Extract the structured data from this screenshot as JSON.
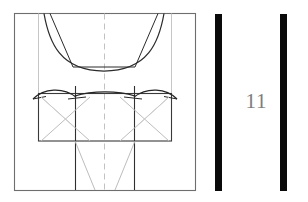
{
  "document": {
    "kind": "technical-line-drawing",
    "figure_number": "11"
  },
  "figure": {
    "frame": {
      "x": 14,
      "y": 13,
      "width": 181,
      "height": 177,
      "stroke": "#6e6e6e",
      "stroke_width": 1.1
    },
    "centerline": {
      "name": "vertical-centerline",
      "x": 104,
      "y1": 13,
      "y2": 190,
      "stroke": "#c2c2c2",
      "stroke_width": 1,
      "dash": "5 4"
    },
    "construction_verticals": [
      {
        "name": "left-construction-vertical",
        "x": 38,
        "y1": 13,
        "y2": 93,
        "stroke": "#c6c6c6"
      },
      {
        "name": "right-construction-vertical",
        "x": 172,
        "y1": 13,
        "y2": 93,
        "stroke": "#c6c6c6"
      }
    ],
    "upper_curve": {
      "name": "parabolic-arc",
      "stroke": "#2b2b2b",
      "stroke_width": 1.2,
      "path": "M 44 13 C 50 44, 62 71, 104 71 C 146 71, 158 44, 164 13"
    },
    "upper_chords": {
      "name": "inscribed-trapezoid",
      "stroke": "#2b2b2b",
      "stroke_width": 1.0,
      "points": "50 13, 73 67, 135 67, 158 13"
    },
    "upper_chord_base": {
      "name": "trapezoid-base",
      "x1": 73,
      "y1": 67,
      "x2": 135,
      "y2": 67
    },
    "body_rect": {
      "name": "central-rectangle",
      "x": 38,
      "y": 93,
      "width": 134,
      "height": 48,
      "stroke": "#3a3a3a",
      "stroke_width": 1.1
    },
    "body_dividers": [
      {
        "name": "divider-left",
        "x": 75,
        "y1": 87,
        "y2": 141
      },
      {
        "name": "divider-right",
        "x": 135,
        "y1": 87,
        "y2": 141
      }
    ],
    "arch_curves": [
      {
        "name": "arch-left",
        "path": "M 33 99 C 45 89, 63 87, 75 96"
      },
      {
        "name": "arch-center",
        "path": "M 75 96 C 90 91, 120 91, 135 96"
      },
      {
        "name": "arch-right",
        "path": "M 135 96 C 147 87, 165 89, 177 99"
      }
    ],
    "arch_tails": [
      {
        "name": "arch-tail-left",
        "path": "M 33 99 L 44 96"
      },
      {
        "name": "arch-tail-right",
        "path": "M 177 99 L 166 96"
      }
    ],
    "cross_hatches": [
      {
        "name": "hatch-left-a",
        "x1": 40,
        "y1": 97,
        "x2": 88,
        "y2": 141
      },
      {
        "name": "hatch-left-b",
        "x1": 88,
        "y1": 97,
        "x2": 40,
        "y2": 141
      },
      {
        "name": "hatch-right-a",
        "x1": 122,
        "y1": 97,
        "x2": 170,
        "y2": 141
      },
      {
        "name": "hatch-right-b",
        "x1": 170,
        "y1": 97,
        "x2": 122,
        "y2": 141
      }
    ],
    "lower_verticals": [
      {
        "name": "lower-vertical-left",
        "x": 75,
        "y1": 141,
        "y2": 190
      },
      {
        "name": "lower-vertical-right",
        "x": 135,
        "y1": 141,
        "y2": 190
      }
    ],
    "lower_diagonals": [
      {
        "name": "taper-left",
        "x1": 75,
        "y1": 141,
        "x2": 93,
        "y2": 190
      },
      {
        "name": "taper-right",
        "x1": 135,
        "y1": 141,
        "x2": 117,
        "y2": 190
      }
    ],
    "colors": {
      "ink_dark": "#2b2b2b",
      "ink_mid": "#3a3a3a",
      "frame": "#6e6e6e",
      "construction": "#c2c2c2",
      "hatch": "#bdbdbd",
      "bar_black": "#0a0a0a",
      "label_gray": "#7d7d7d",
      "background": "#ffffff"
    }
  },
  "label_panel": {
    "bars": [
      {
        "name": "rule-bar-left"
      },
      {
        "name": "rule-bar-right"
      }
    ],
    "figure_number": "11"
  }
}
